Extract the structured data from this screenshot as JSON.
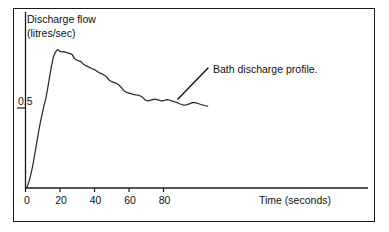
{
  "chart_data": {
    "type": "line",
    "title": "",
    "xlabel": "Time (seconds)",
    "ylabel": "Discharge flow (litres/sec)",
    "ylabel_line1": "Discharge flow",
    "ylabel_line2": "(litres/sec)",
    "xlim": [
      0,
      105
    ],
    "ylim": [
      0,
      1.1
    ],
    "grid": false,
    "legend": "none",
    "xticks": [
      0,
      20,
      40,
      60,
      80
    ],
    "xtick_labels": [
      "0",
      "20",
      "40",
      "60",
      "80"
    ],
    "yticks": [
      0.5
    ],
    "ytick_labels": [
      "0.5"
    ],
    "annotations": [
      {
        "text": "Bath discharge profile.",
        "leader_from_x": 60,
        "leader_from_y": 0.56,
        "leader_to_x": 77,
        "leader_to_y": 0.75
      }
    ],
    "series": [
      {
        "name": "Bath discharge profile",
        "x": [
          0.6,
          1.4,
          2.3,
          3.2,
          4.2,
          5.2,
          6.3,
          7.4,
          8.6,
          9.8,
          10.8,
          11.8,
          12.8,
          13.9,
          15.0,
          16.2,
          17.4,
          18.6,
          19.8,
          21.0,
          22.2,
          23.4,
          24.6,
          25.8,
          27.0,
          28.3,
          29.6,
          30.9,
          32.2,
          33.5,
          34.8,
          36.1,
          37.4,
          38.7,
          40.0,
          41.4,
          42.8,
          44.2,
          45.6,
          47.0,
          48.4,
          49.8,
          51.2,
          52.6,
          54.0,
          55.4,
          56.8,
          58.2,
          59.6,
          61.0,
          62.4,
          63.8,
          65.2,
          66.6,
          68.0,
          69.4,
          70.8,
          72.2,
          73.6,
          75.0,
          76.4,
          77.8,
          79.2,
          80.6,
          82.0,
          83.4,
          84.8,
          86.2,
          87.6,
          89.0,
          90.4,
          91.8,
          93.2,
          94.6,
          96.0,
          97.4,
          98.8,
          100.2,
          101.6,
          103.0,
          104.4,
          105.6
        ],
        "y": [
          0.0,
          0.02,
          0.05,
          0.09,
          0.14,
          0.2,
          0.27,
          0.34,
          0.41,
          0.47,
          0.52,
          0.56,
          0.62,
          0.69,
          0.76,
          0.82,
          0.85,
          0.865,
          0.855,
          0.85,
          0.852,
          0.848,
          0.845,
          0.84,
          0.835,
          0.81,
          0.8,
          0.795,
          0.79,
          0.775,
          0.765,
          0.76,
          0.752,
          0.745,
          0.74,
          0.73,
          0.72,
          0.715,
          0.705,
          0.695,
          0.675,
          0.665,
          0.66,
          0.655,
          0.645,
          0.63,
          0.61,
          0.6,
          0.595,
          0.59,
          0.585,
          0.582,
          0.58,
          0.575,
          0.565,
          0.55,
          0.545,
          0.548,
          0.552,
          0.555,
          0.552,
          0.548,
          0.545,
          0.548,
          0.552,
          0.55,
          0.545,
          0.54,
          0.535,
          0.528,
          0.522,
          0.518,
          0.52,
          0.524,
          0.53,
          0.535,
          0.532,
          0.528,
          0.522,
          0.518,
          0.514,
          0.512
        ]
      }
    ]
  },
  "axes": {
    "y_title_line1": "Discharge flow",
    "y_title_line2": "(litres/sec)",
    "x_title": "Time (seconds)",
    "y_tick_0": "0.5",
    "x_tick_0": "0",
    "x_tick_1": "20",
    "x_tick_2": "40",
    "x_tick_3": "60",
    "x_tick_4": "80"
  },
  "annotation": {
    "label": "Bath discharge profile."
  },
  "colors": {
    "curve": "#2a2a2a",
    "axis": "#1a1a1a",
    "frame": "#1a1a1a",
    "background": "#ffffff",
    "text": "#111111"
  }
}
